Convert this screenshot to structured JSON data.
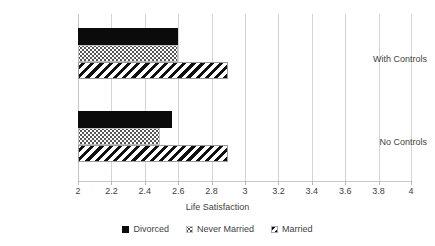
{
  "chart_data": {
    "type": "bar",
    "orientation": "horizontal",
    "title": "",
    "xlabel": "Life Satisfaction",
    "ylabel": "",
    "xlim": [
      2,
      4
    ],
    "xticks": [
      "2",
      "2.2",
      "2.4",
      "2.6",
      "2.8",
      "3",
      "3.2",
      "3.4",
      "3.6",
      "3.8",
      "4"
    ],
    "xtick_values": [
      2,
      2.2,
      2.4,
      2.6,
      2.8,
      3,
      3.2,
      3.4,
      3.6,
      3.8,
      4
    ],
    "grid": true,
    "grid_axis": "x",
    "legend_position": "bottom",
    "categories": [
      "With Controls",
      "No Controls"
    ],
    "series": [
      {
        "name": "Divorced",
        "pattern": "solid-black",
        "values": [
          2.6,
          2.56
        ]
      },
      {
        "name": "Never Married",
        "pattern": "dotted",
        "values": [
          2.6,
          2.49
        ]
      },
      {
        "name": "Married",
        "pattern": "diagonal-hatch",
        "values": [
          2.9,
          2.9
        ]
      }
    ]
  },
  "axis": {
    "x_title": "Life Satisfaction"
  },
  "legend": {
    "items": [
      {
        "label": "Divorced",
        "swatch": "solid-black-swatch-icon"
      },
      {
        "label": "Never Married",
        "swatch": "dotted-swatch-icon"
      },
      {
        "label": "Married",
        "swatch": "hatched-swatch-icon"
      }
    ]
  }
}
